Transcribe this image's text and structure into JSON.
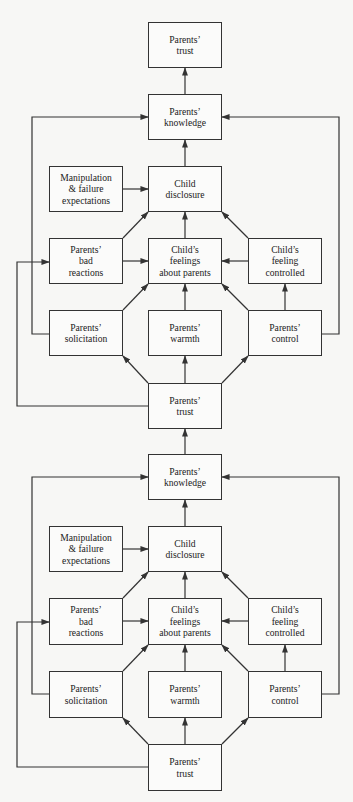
{
  "diagram": {
    "colors": {
      "line": "#333333",
      "box_border": "#333333",
      "background": "#f7f7f5",
      "text": "#222222"
    },
    "nodes": [
      {
        "id": "trust_top",
        "label": "Parents’\ntrust",
        "x": 148,
        "y": 22,
        "w": 74,
        "h": 46
      },
      {
        "id": "knowledge_1",
        "label": "Parents’\nknowledge",
        "x": 148,
        "y": 94,
        "w": 74,
        "h": 46
      },
      {
        "id": "manip_1",
        "label": "Manipulation\n& failure\nexpectations",
        "x": 49,
        "y": 166,
        "w": 74,
        "h": 46
      },
      {
        "id": "disclosure_1",
        "label": "Child\ndisclosure",
        "x": 148,
        "y": 166,
        "w": 74,
        "h": 46
      },
      {
        "id": "bad_1",
        "label": "Parents’\nbad\nreactions",
        "x": 49,
        "y": 238,
        "w": 74,
        "h": 46
      },
      {
        "id": "feelings_1",
        "label": "Child’s\nfeelings\nabout parents",
        "x": 148,
        "y": 238,
        "w": 74,
        "h": 46
      },
      {
        "id": "controlled_1",
        "label": "Child’s\nfeeling\ncontrolled",
        "x": 248,
        "y": 238,
        "w": 74,
        "h": 46
      },
      {
        "id": "solicitation_1",
        "label": "Parents’\nsolicitation",
        "x": 49,
        "y": 310,
        "w": 74,
        "h": 46
      },
      {
        "id": "warmth_1",
        "label": "Parents’\nwarmth",
        "x": 148,
        "y": 310,
        "w": 74,
        "h": 46
      },
      {
        "id": "control_1",
        "label": "Parents’\ncontrol",
        "x": 248,
        "y": 310,
        "w": 74,
        "h": 46
      },
      {
        "id": "trust_mid",
        "label": "Parents’\ntrust",
        "x": 148,
        "y": 383,
        "w": 74,
        "h": 46
      },
      {
        "id": "knowledge_2",
        "label": "Parents’\nknowledge",
        "x": 148,
        "y": 454,
        "w": 74,
        "h": 46
      },
      {
        "id": "manip_2",
        "label": "Manipulation\n& failure\nexpectations",
        "x": 49,
        "y": 526,
        "w": 74,
        "h": 46
      },
      {
        "id": "disclosure_2",
        "label": "Child\ndisclosure",
        "x": 148,
        "y": 526,
        "w": 74,
        "h": 46
      },
      {
        "id": "bad_2",
        "label": "Parents’\nbad\nreactions",
        "x": 49,
        "y": 598,
        "w": 74,
        "h": 47
      },
      {
        "id": "feelings_2",
        "label": "Child’s\nfeelings\nabout parents",
        "x": 148,
        "y": 598,
        "w": 74,
        "h": 47
      },
      {
        "id": "controlled_2",
        "label": "Child’s\nfeeling\ncontrolled",
        "x": 248,
        "y": 598,
        "w": 74,
        "h": 47
      },
      {
        "id": "solicitation_2",
        "label": "Parents’\nsolicitation",
        "x": 49,
        "y": 671,
        "w": 74,
        "h": 47
      },
      {
        "id": "warmth_2",
        "label": "Parents’\nwarmth",
        "x": 148,
        "y": 671,
        "w": 74,
        "h": 47
      },
      {
        "id": "control_2",
        "label": "Parents’\ncontrol",
        "x": 248,
        "y": 671,
        "w": 74,
        "h": 47
      },
      {
        "id": "trust_bottom",
        "label": "Parents’\ntrust",
        "x": 148,
        "y": 744,
        "w": 74,
        "h": 47
      }
    ],
    "edges": [
      {
        "from": "knowledge_1",
        "to": "trust_top",
        "points": [
          [
            185,
            94
          ],
          [
            185,
            68
          ]
        ]
      },
      {
        "from": "disclosure_1",
        "to": "knowledge_1",
        "points": [
          [
            185,
            166
          ],
          [
            185,
            140
          ]
        ]
      },
      {
        "from": "manip_1",
        "to": "disclosure_1",
        "points": [
          [
            123,
            189
          ],
          [
            148,
            189
          ]
        ]
      },
      {
        "from": "bad_1",
        "to": "disclosure_1",
        "points": [
          [
            123,
            238
          ],
          [
            148,
            212
          ]
        ]
      },
      {
        "from": "feelings_1",
        "to": "disclosure_1",
        "points": [
          [
            185,
            238
          ],
          [
            185,
            212
          ]
        ]
      },
      {
        "from": "controlled_1",
        "to": "disclosure_1",
        "points": [
          [
            248,
            238
          ],
          [
            222,
            212
          ]
        ]
      },
      {
        "from": "bad_1",
        "to": "feelings_1",
        "points": [
          [
            123,
            261
          ],
          [
            148,
            261
          ]
        ]
      },
      {
        "from": "controlled_1",
        "to": "feelings_1",
        "points": [
          [
            248,
            261
          ],
          [
            222,
            261
          ]
        ]
      },
      {
        "from": "solicitation_1",
        "to": "feelings_1",
        "points": [
          [
            123,
            310
          ],
          [
            148,
            284
          ]
        ]
      },
      {
        "from": "warmth_1",
        "to": "feelings_1",
        "points": [
          [
            185,
            310
          ],
          [
            185,
            284
          ]
        ]
      },
      {
        "from": "control_1",
        "to": "feelings_1",
        "points": [
          [
            248,
            310
          ],
          [
            222,
            284
          ]
        ]
      },
      {
        "from": "control_1",
        "to": "controlled_1",
        "points": [
          [
            285,
            310
          ],
          [
            285,
            284
          ]
        ]
      },
      {
        "from": "solicitation_1",
        "to": "knowledge_1",
        "points": [
          [
            49,
            334
          ],
          [
            32,
            334
          ],
          [
            32,
            117
          ],
          [
            148,
            117
          ]
        ]
      },
      {
        "from": "control_1",
        "to": "knowledge_1",
        "points": [
          [
            322,
            334
          ],
          [
            339,
            334
          ],
          [
            339,
            117
          ],
          [
            222,
            117
          ]
        ]
      },
      {
        "from": "trust_mid",
        "to": "bad_1",
        "points": [
          [
            148,
            406
          ],
          [
            17,
            406
          ],
          [
            17,
            262
          ],
          [
            49,
            262
          ]
        ]
      },
      {
        "from": "trust_mid",
        "to": "solicitation_1",
        "points": [
          [
            148,
            383
          ],
          [
            123,
            356
          ]
        ]
      },
      {
        "from": "trust_mid",
        "to": "warmth_1",
        "points": [
          [
            185,
            383
          ],
          [
            185,
            356
          ]
        ]
      },
      {
        "from": "trust_mid",
        "to": "control_1",
        "points": [
          [
            222,
            383
          ],
          [
            248,
            356
          ]
        ]
      },
      {
        "from": "knowledge_2",
        "to": "trust_mid",
        "points": [
          [
            185,
            454
          ],
          [
            185,
            429
          ]
        ]
      },
      {
        "from": "disclosure_2",
        "to": "knowledge_2",
        "points": [
          [
            185,
            526
          ],
          [
            185,
            500
          ]
        ]
      },
      {
        "from": "manip_2",
        "to": "disclosure_2",
        "points": [
          [
            123,
            549
          ],
          [
            148,
            549
          ]
        ]
      },
      {
        "from": "bad_2",
        "to": "disclosure_2",
        "points": [
          [
            123,
            598
          ],
          [
            148,
            572
          ]
        ]
      },
      {
        "from": "feelings_2",
        "to": "disclosure_2",
        "points": [
          [
            185,
            598
          ],
          [
            185,
            572
          ]
        ]
      },
      {
        "from": "controlled_2",
        "to": "disclosure_2",
        "points": [
          [
            248,
            598
          ],
          [
            222,
            572
          ]
        ]
      },
      {
        "from": "bad_2",
        "to": "feelings_2",
        "points": [
          [
            123,
            621
          ],
          [
            148,
            621
          ]
        ]
      },
      {
        "from": "controlled_2",
        "to": "feelings_2",
        "points": [
          [
            248,
            621
          ],
          [
            222,
            621
          ]
        ]
      },
      {
        "from": "solicitation_2",
        "to": "feelings_2",
        "points": [
          [
            123,
            671
          ],
          [
            148,
            645
          ]
        ]
      },
      {
        "from": "warmth_2",
        "to": "feelings_2",
        "points": [
          [
            185,
            671
          ],
          [
            185,
            645
          ]
        ]
      },
      {
        "from": "control_2",
        "to": "feelings_2",
        "points": [
          [
            248,
            671
          ],
          [
            222,
            645
          ]
        ]
      },
      {
        "from": "control_2",
        "to": "controlled_2",
        "points": [
          [
            285,
            671
          ],
          [
            285,
            645
          ]
        ]
      },
      {
        "from": "solicitation_2",
        "to": "knowledge_2",
        "points": [
          [
            49,
            694
          ],
          [
            32,
            694
          ],
          [
            32,
            477
          ],
          [
            148,
            477
          ]
        ]
      },
      {
        "from": "control_2",
        "to": "knowledge_2",
        "points": [
          [
            322,
            694
          ],
          [
            339,
            694
          ],
          [
            339,
            477
          ],
          [
            222,
            477
          ]
        ]
      },
      {
        "from": "trust_bottom",
        "to": "bad_2",
        "points": [
          [
            148,
            767
          ],
          [
            17,
            767
          ],
          [
            17,
            622
          ],
          [
            49,
            622
          ]
        ]
      },
      {
        "from": "trust_bottom",
        "to": "solicitation_2",
        "points": [
          [
            148,
            744
          ],
          [
            123,
            718
          ]
        ]
      },
      {
        "from": "trust_bottom",
        "to": "warmth_2",
        "points": [
          [
            185,
            744
          ],
          [
            185,
            718
          ]
        ]
      },
      {
        "from": "trust_bottom",
        "to": "control_2",
        "points": [
          [
            222,
            744
          ],
          [
            248,
            718
          ]
        ]
      }
    ]
  }
}
